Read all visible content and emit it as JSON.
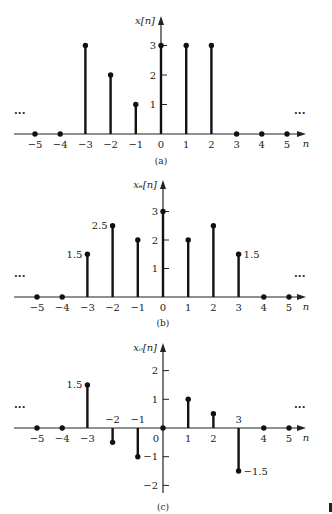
{
  "chart_data": [
    {
      "type": "stem",
      "caption": "(a)",
      "ylabel": "x[n]",
      "xlabel": "n",
      "x": [
        -5,
        -4,
        -3,
        -2,
        -1,
        0,
        1,
        2,
        3,
        4,
        5
      ],
      "values": [
        0,
        0,
        3,
        2,
        1,
        3,
        3,
        3,
        0,
        0,
        0
      ],
      "yticks": [
        1,
        2,
        3
      ],
      "ellipsis": "···",
      "value_labels": []
    },
    {
      "type": "stem",
      "caption": "(b)",
      "ylabel": "x_e[n]",
      "xlabel": "n",
      "x": [
        -5,
        -4,
        -3,
        -2,
        -1,
        0,
        1,
        2,
        3,
        4,
        5
      ],
      "values": [
        0,
        0,
        1.5,
        2.5,
        2,
        3,
        2,
        2.5,
        1.5,
        0,
        0
      ],
      "yticks": [
        1,
        2,
        3
      ],
      "ellipsis": "···",
      "value_labels": [
        {
          "n": -3,
          "text": "1.5",
          "side": "left"
        },
        {
          "n": -2,
          "text": "2.5",
          "side": "left"
        },
        {
          "n": 3,
          "text": "1.5",
          "side": "right"
        }
      ]
    },
    {
      "type": "stem",
      "caption": "(c)",
      "ylabel": "x_o[n]",
      "xlabel": "n",
      "x": [
        -5,
        -4,
        -3,
        -2,
        -1,
        0,
        1,
        2,
        3,
        4,
        5
      ],
      "values": [
        0,
        0,
        1.5,
        -0.5,
        -1,
        0,
        1,
        0.5,
        -1.5,
        0,
        0
      ],
      "yticks": [
        -2,
        -1,
        1,
        2
      ],
      "ellipsis": "···",
      "value_labels": [
        {
          "n": -3,
          "text": "1.5",
          "side": "left"
        },
        {
          "n": 3,
          "text": "−1.5",
          "side": "right"
        }
      ]
    }
  ]
}
